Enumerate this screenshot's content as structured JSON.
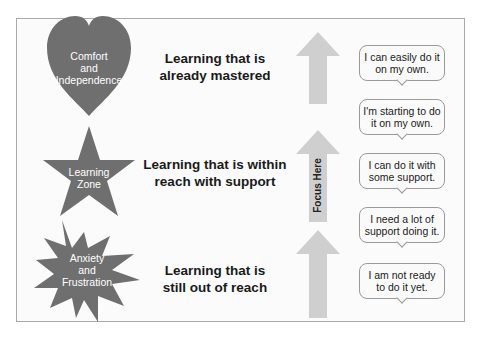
{
  "colors": {
    "shape_fill": "#6f6f6f",
    "arrow_fill": "#cfcfcf",
    "frame_border": "#a9a9a9",
    "text_dark": "#1a1a1a"
  },
  "zones": [
    {
      "shape": "heart",
      "label_lines": [
        "Comfort",
        "and",
        "Independence"
      ],
      "description_lines": [
        "Learning that is",
        "already mastered"
      ]
    },
    {
      "shape": "star",
      "label_lines": [
        "Learning",
        "Zone"
      ],
      "description_lines": [
        "Learning that is within",
        "reach with support"
      ]
    },
    {
      "shape": "burst",
      "label_lines": [
        "Anxiety",
        "and",
        "Frustration"
      ],
      "description_lines": [
        "Learning that is",
        "still out of reach"
      ]
    }
  ],
  "focus_arrow": {
    "label": "Focus Here"
  },
  "bubbles": [
    {
      "lines": [
        "I can easily do it",
        "on my own."
      ]
    },
    {
      "lines": [
        "I'm starting to do",
        "it on my own."
      ]
    },
    {
      "lines": [
        "I can do it with",
        "some support."
      ]
    },
    {
      "lines": [
        "I need a lot of",
        "support doing it."
      ]
    },
    {
      "lines": [
        "I am not ready",
        "to do it yet."
      ]
    }
  ]
}
